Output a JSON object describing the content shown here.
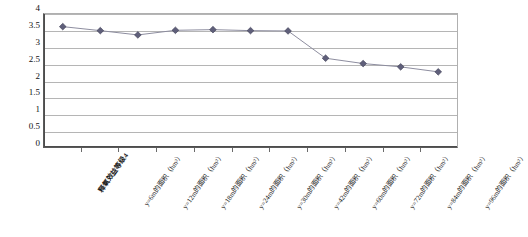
{
  "chart_data": {
    "type": "line",
    "title": "",
    "subtitle": "",
    "xlabel": "",
    "ylabel": "",
    "ylim": [
      0,
      4
    ],
    "ytick_step": 0.5,
    "yticks": [
      "4",
      "3.5",
      "3",
      "2.5",
      "2",
      "1.5",
      "1",
      "0.5",
      "0"
    ],
    "ytick_values": [
      4,
      3.5,
      3,
      2.5,
      2,
      1.5,
      1,
      0.5,
      0
    ],
    "grid": true,
    "legend": false,
    "legend_position": "none",
    "marker": "diamond",
    "marker_color": "#5f5f7a",
    "line_color": "#8c8c9e",
    "categories": [
      "释氧效益等级4",
      "y=6m的面积（hm²）",
      "y=12m的面积（hm²）",
      "y=18m的面积（hm²）",
      "y=24m的面积（hm²）",
      "y=30m的面积（hm²）",
      "y=42m的面积（hm²）",
      "y=60m的面积（hm²）",
      "y=72m的面积（hm²）",
      "y=84m的面积（hm²）",
      "y=96m的面积（hm²）"
    ],
    "series": [
      {
        "name": "释氧效益等级4",
        "values": [
          3.62,
          3.5,
          3.37,
          3.51,
          3.53,
          3.5,
          3.49,
          2.67,
          2.51,
          2.41,
          2.26
        ]
      }
    ]
  }
}
